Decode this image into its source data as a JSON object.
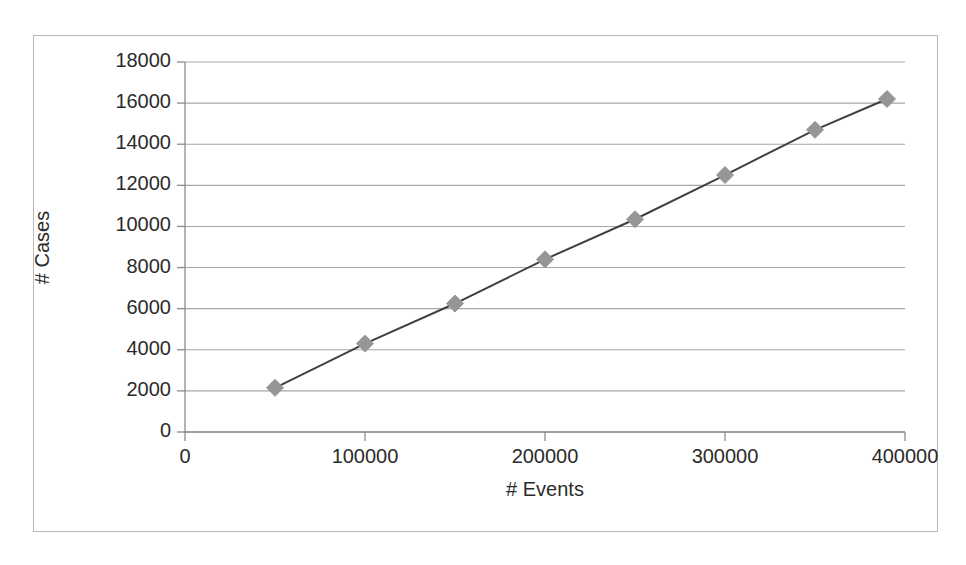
{
  "chart_data": {
    "type": "scatter",
    "title": "",
    "subtitle": "",
    "xlabel": "# Events",
    "ylabel": "# Cases",
    "xlim": [
      0,
      400000
    ],
    "ylim": [
      0,
      18000
    ],
    "grid": "horizontal",
    "legend": "none",
    "marker": {
      "shape": "diamond",
      "color": "#969696",
      "size": 17
    },
    "line": {
      "color": "#404040",
      "width": 2,
      "style": "solid"
    },
    "x_ticks": [
      0,
      100000,
      200000,
      300000,
      400000
    ],
    "x_tick_labels": [
      "0",
      "100000",
      "200000",
      "300000",
      "400000"
    ],
    "y_ticks": [
      0,
      2000,
      4000,
      6000,
      8000,
      10000,
      12000,
      14000,
      16000,
      18000
    ],
    "y_tick_labels": [
      "0",
      "2000",
      "4000",
      "6000",
      "8000",
      "10000",
      "12000",
      "14000",
      "16000",
      "18000"
    ],
    "series": [
      {
        "name": "# Cases vs # Events",
        "x": [
          50000,
          100000,
          150000,
          200000,
          250000,
          300000,
          350000,
          390000
        ],
        "y": [
          2150,
          4300,
          6250,
          8400,
          10350,
          12500,
          14700,
          16200
        ]
      }
    ]
  }
}
